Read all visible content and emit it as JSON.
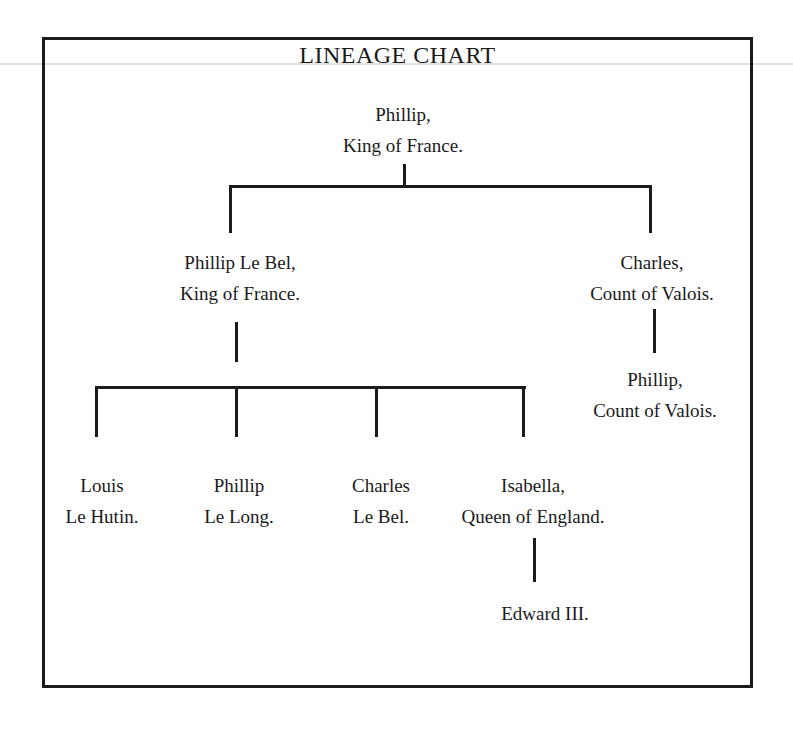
{
  "title": "LINEAGE CHART",
  "nodes": [
    {
      "id": "phillip-king-of-france",
      "lines": [
        "Phillip,",
        "King of France."
      ]
    },
    {
      "id": "phillip-le-bel",
      "lines": [
        "Phillip Le Bel,",
        "King of France."
      ]
    },
    {
      "id": "charles-count-of-valois",
      "lines": [
        "Charles,",
        "Count of Valois."
      ]
    },
    {
      "id": "phillip-count-of-valois",
      "lines": [
        "Phillip,",
        "Count of Valois."
      ]
    },
    {
      "id": "louis-le-hutin",
      "lines": [
        "Louis",
        "Le Hutin."
      ]
    },
    {
      "id": "phillip-le-long",
      "lines": [
        "Phillip",
        "Le Long."
      ]
    },
    {
      "id": "charles-le-bel",
      "lines": [
        "Charles",
        "Le Bel."
      ]
    },
    {
      "id": "isabella-queen-of-england",
      "lines": [
        "Isabella,",
        "Queen of England."
      ]
    },
    {
      "id": "edward-iii",
      "lines": [
        "Edward III."
      ]
    }
  ],
  "edges": [
    {
      "parent": "Phillip, King of France.",
      "children": [
        "Phillip Le Bel, King of France.",
        "Charles, Count of Valois."
      ]
    },
    {
      "parent": "Charles, Count of Valois.",
      "children": [
        "Phillip, Count of Valois."
      ]
    },
    {
      "parent": "Phillip Le Bel, King of France.",
      "children": [
        "Louis Le Hutin.",
        "Phillip Le Long.",
        "Charles Le Bel.",
        "Isabella, Queen of England."
      ]
    },
    {
      "parent": "Isabella, Queen of England.",
      "children": [
        "Edward III."
      ]
    }
  ],
  "colors": {
    "text": "#1a1a1a",
    "line": "#1b1b1b",
    "background": "#ffffff",
    "scan_artifact_line": "#e3e0e0"
  }
}
